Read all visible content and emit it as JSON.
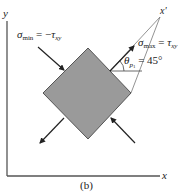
{
  "figure": {
    "caption": "(b)",
    "axes": {
      "x_label": "x",
      "y_label": "y",
      "x_prime_label": "x'"
    },
    "element": {
      "shape": "square rotated 45°",
      "fill_color": "#9a9a9a",
      "stroke_color": "#555555"
    },
    "annotations": {
      "sigma_min": {
        "symbol": "σ",
        "subscript": "min",
        "equals": " = −",
        "rhs_symbol": "τ",
        "rhs_subscript": "xy"
      },
      "sigma_max": {
        "symbol": "σ",
        "subscript": "max",
        "equals": " = ",
        "rhs_symbol": "τ",
        "rhs_subscript": "xy"
      },
      "theta": {
        "symbol": "θ",
        "subscript": "p",
        "subsubscript": "1",
        "equals": " = 45°"
      }
    },
    "colors": {
      "axis": "#555555",
      "arrow": "#222222",
      "text": "#222222"
    }
  }
}
